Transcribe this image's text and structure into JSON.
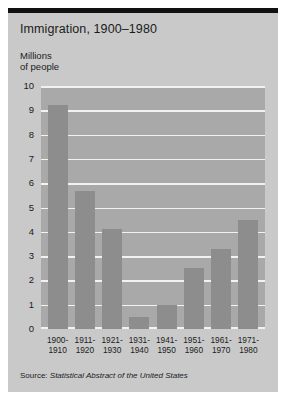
{
  "chart_data": {
    "type": "bar",
    "title": "Immigration, 1900–1980",
    "ylabel": "Millions\nof people",
    "ylabel_line1": "Millions",
    "ylabel_line2": "of people",
    "xlabel": "",
    "categories": [
      "1900–\n1910",
      "1911–\n1920",
      "1921–\n1930",
      "1931–\n1940",
      "1941–\n1950",
      "1951–\n1960",
      "1961–\n1970",
      "1971–\n1980"
    ],
    "category_lines": [
      {
        "top": "1900-",
        "bottom": "1910"
      },
      {
        "top": "1911-",
        "bottom": "1920"
      },
      {
        "top": "1921-",
        "bottom": "1930"
      },
      {
        "top": "1931-",
        "bottom": "1940"
      },
      {
        "top": "1941-",
        "bottom": "1950"
      },
      {
        "top": "1951-",
        "bottom": "1960"
      },
      {
        "top": "1961-",
        "bottom": "1970"
      },
      {
        "top": "1971-",
        "bottom": "1980"
      }
    ],
    "values": [
      9.2,
      5.7,
      4.1,
      0.5,
      1.0,
      2.5,
      3.3,
      4.5
    ],
    "ylim": [
      0,
      10
    ],
    "yticks": [
      10,
      9,
      8,
      7,
      6,
      5,
      4,
      3,
      2,
      1,
      0
    ],
    "grid": true,
    "legend": null,
    "bar_color": "#8d8d8d",
    "plot_background": "#a9a9a9",
    "gridline_color": "#f2f2f2",
    "panel_background": "#c9c9c9"
  },
  "source": {
    "label": "Source:",
    "publication": "Statistical Abstract of the United States"
  }
}
